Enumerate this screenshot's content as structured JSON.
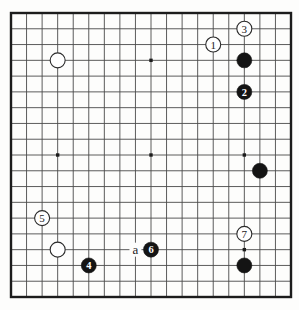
{
  "diagram": {
    "type": "go-board-diagram",
    "board_size": 19,
    "colors": {
      "paper": "#fdfdfc",
      "grid_line": "#4a4a4a",
      "border": "#1c1c1c",
      "star_point": "#1c1c1c",
      "black_stone": "#141414",
      "white_stone": "#ffffff",
      "white_stone_outline": "#2a2a2a",
      "white_stone_number": "#1c1c1c",
      "black_stone_number": "#ffffff",
      "label_text": "#1c1c1c"
    },
    "star_points": [
      {
        "col": 4,
        "row": 4
      },
      {
        "col": 10,
        "row": 4
      },
      {
        "col": 16,
        "row": 4
      },
      {
        "col": 4,
        "row": 10
      },
      {
        "col": 10,
        "row": 10
      },
      {
        "col": 16,
        "row": 10
      },
      {
        "col": 4,
        "row": 16
      },
      {
        "col": 10,
        "row": 16
      },
      {
        "col": 16,
        "row": 16
      }
    ],
    "stones": [
      {
        "color": "white",
        "label": "",
        "col": 4,
        "row": 4
      },
      {
        "color": "white",
        "label": "",
        "col": 4,
        "row": 16
      },
      {
        "color": "black",
        "label": "",
        "col": 16,
        "row": 4
      },
      {
        "color": "black",
        "label": "",
        "col": 17,
        "row": 11
      },
      {
        "color": "black",
        "label": "",
        "col": 16,
        "row": 17
      },
      {
        "color": "white",
        "label": "1",
        "col": 14,
        "row": 3
      },
      {
        "color": "black",
        "label": "2",
        "col": 16,
        "row": 6
      },
      {
        "color": "white",
        "label": "3",
        "col": 16,
        "row": 2
      },
      {
        "color": "black",
        "label": "4",
        "col": 6,
        "row": 17
      },
      {
        "color": "white",
        "label": "5",
        "col": 3,
        "row": 14
      },
      {
        "color": "black",
        "label": "6",
        "col": 10,
        "row": 16
      },
      {
        "color": "white",
        "label": "7",
        "col": 16,
        "row": 15
      }
    ],
    "point_labels": [
      {
        "label": "a",
        "col": 9,
        "row": 16
      }
    ]
  }
}
